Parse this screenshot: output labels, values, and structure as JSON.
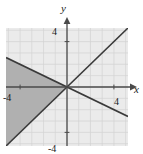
{
  "chart_data": {
    "type": "line",
    "title": "",
    "subtitle": "",
    "xlabel": "x",
    "ylabel": "y",
    "xlim": [
      -5.2,
      5.2
    ],
    "ylim": [
      -5.2,
      5.2
    ],
    "grid": true,
    "gridStep": 1,
    "legend": "none",
    "axis_arrows": true,
    "xticks": [
      -4,
      4
    ],
    "yticks": [
      -4,
      4
    ],
    "xtick_labels": [
      "-4",
      "4"
    ],
    "ytick_labels": [
      "-4",
      "4"
    ],
    "series": [
      {
        "name": "line-1",
        "type": "line",
        "slope": 1,
        "intercept": 0,
        "points": [
          [
            -5.2,
            -5.2
          ],
          [
            5.2,
            5.2
          ]
        ],
        "color": "#3a3a3a",
        "width": 1.6
      },
      {
        "name": "line-2",
        "type": "line",
        "slope": -0.5,
        "intercept": 0,
        "points": [
          [
            -5.2,
            2.6
          ],
          [
            5.2,
            -2.6
          ]
        ],
        "color": "#3a3a3a",
        "width": 1.6
      }
    ],
    "shaded_regions": [
      {
        "name": "solution-region",
        "description": "wedge left of the intersection bounded above by the negative-slope line and below by the positive-slope line",
        "vertices": [
          [
            0,
            0
          ],
          [
            -5.2,
            2.6
          ],
          [
            -5.2,
            -5.2
          ],
          [
            0,
            0
          ]
        ],
        "fill": "#b0b0b0",
        "opacity": 1
      }
    ],
    "colors": {
      "plot_background": "#ebebeb",
      "grid_line": "#d2d2d2",
      "axis": "#4a4a4a",
      "shade": "#b0b0b0",
      "line": "#3a3a3a",
      "text": "#1a1a1a",
      "page_background": "#ffffff"
    }
  },
  "labels": {
    "x_axis": "x",
    "y_axis": "y",
    "x_neg_tick": "-4",
    "x_pos_tick": "4",
    "y_pos_tick": "4",
    "y_neg_tick": "-4"
  }
}
